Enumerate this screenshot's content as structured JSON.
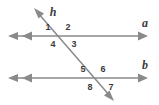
{
  "figure": {
    "background_color": "#ffffff",
    "line_color": "#8a8a8a",
    "label_color": "#3b3b3b"
  },
  "lines": {
    "top_parallel": {
      "name": "a",
      "label": "a",
      "orientation": "horizontal",
      "y": 36,
      "x_start": 8,
      "x_end": 148,
      "left_arrowheads": 2,
      "right_arrowheads": 1
    },
    "bottom_parallel": {
      "name": "b",
      "label": "b",
      "orientation": "horizontal",
      "y": 78,
      "x_start": 8,
      "x_end": 148,
      "left_arrowheads": 2,
      "right_arrowheads": 1
    },
    "transversal": {
      "name": "h",
      "label": "h",
      "orientation": "diagonal",
      "x_start": 35,
      "y_start": 9,
      "x_end": 113,
      "y_end": 100,
      "top_arrowheads": 1,
      "bottom_arrowheads": 1
    }
  },
  "intersections": [
    {
      "name": "top-intersection",
      "on_line": "a",
      "x": 58,
      "y": 36,
      "angles": [
        {
          "number": "1",
          "position": "upper-left",
          "x": 48,
          "y": 28
        },
        {
          "number": "2",
          "position": "upper-right",
          "x": 68,
          "y": 28
        },
        {
          "number": "4",
          "position": "lower-left",
          "x": 53,
          "y": 45
        },
        {
          "number": "3",
          "position": "lower-right",
          "x": 73,
          "y": 45
        }
      ]
    },
    {
      "name": "bottom-intersection",
      "on_line": "b",
      "x": 94,
      "y": 78,
      "angles": [
        {
          "number": "5",
          "position": "upper-left",
          "x": 83,
          "y": 70
        },
        {
          "number": "6",
          "position": "upper-right",
          "x": 103,
          "y": 70
        },
        {
          "number": "8",
          "position": "lower-left",
          "x": 90,
          "y": 87
        },
        {
          "number": "7",
          "position": "lower-right",
          "x": 110,
          "y": 87
        }
      ]
    }
  ],
  "labels": {
    "line_a": {
      "text": "a",
      "x": 145,
      "y": 25
    },
    "line_b": {
      "text": "b",
      "x": 145,
      "y": 67
    },
    "line_h": {
      "text": "h",
      "x": 52,
      "y": 13
    }
  }
}
